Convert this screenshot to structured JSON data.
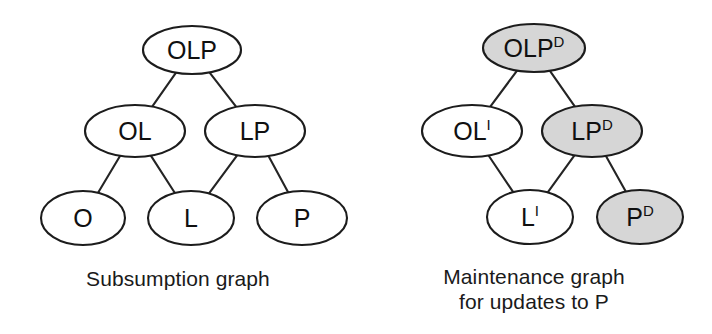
{
  "figure": {
    "background_color": "#ffffff",
    "node_stroke_color": "#1c1c1c",
    "node_fill_white": "#ffffff",
    "node_fill_gray": "#d6d6d6",
    "edge_color": "#242424",
    "text_color": "#101010"
  },
  "panels": [
    {
      "id": "subsumption",
      "caption_lines": [
        "Subsumption graph"
      ],
      "nodes": [
        {
          "id": "OLP",
          "base": "OLP",
          "sup": "",
          "fill": "white",
          "cx": 192,
          "cy": 50,
          "rx": 49,
          "ry": 24
        },
        {
          "id": "OL",
          "base": "OL",
          "sup": "",
          "fill": "white",
          "cx": 135,
          "cy": 131,
          "rx": 50,
          "ry": 26
        },
        {
          "id": "LP",
          "base": "LP",
          "sup": "",
          "fill": "white",
          "cx": 255,
          "cy": 131,
          "rx": 50,
          "ry": 26
        },
        {
          "id": "O",
          "base": "O",
          "sup": "",
          "fill": "white",
          "cx": 83,
          "cy": 218,
          "rx": 42,
          "ry": 27
        },
        {
          "id": "L",
          "base": "L",
          "sup": "",
          "fill": "white",
          "cx": 191,
          "cy": 218,
          "rx": 43,
          "ry": 27
        },
        {
          "id": "P",
          "base": "P",
          "sup": "",
          "fill": "white",
          "cx": 302,
          "cy": 218,
          "rx": 45,
          "ry": 27
        }
      ],
      "edges": [
        {
          "from": "OLP",
          "to": "OL"
        },
        {
          "from": "OLP",
          "to": "LP"
        },
        {
          "from": "OL",
          "to": "O"
        },
        {
          "from": "OL",
          "to": "L"
        },
        {
          "from": "LP",
          "to": "L"
        },
        {
          "from": "LP",
          "to": "P"
        }
      ]
    },
    {
      "id": "maintenance",
      "caption_lines": [
        "Maintenance graph",
        "for updates to P"
      ],
      "nodes": [
        {
          "id": "OLP_D",
          "base": "OLP",
          "sup": "D",
          "fill": "gray",
          "cx": 178,
          "cy": 48,
          "rx": 51,
          "ry": 24
        },
        {
          "id": "OL_I",
          "base": "OL",
          "sup": "I",
          "fill": "white",
          "cx": 116,
          "cy": 131,
          "rx": 50,
          "ry": 26
        },
        {
          "id": "LP_D",
          "base": "LP",
          "sup": "D",
          "fill": "gray",
          "cx": 236,
          "cy": 131,
          "rx": 50,
          "ry": 26
        },
        {
          "id": "L_I",
          "base": "L",
          "sup": "I",
          "fill": "white",
          "cx": 174,
          "cy": 217,
          "rx": 43,
          "ry": 27
        },
        {
          "id": "P_D",
          "base": "P",
          "sup": "D",
          "fill": "gray",
          "cx": 284,
          "cy": 217,
          "rx": 43,
          "ry": 27
        }
      ],
      "edges": [
        {
          "from": "OLP_D",
          "to": "OL_I"
        },
        {
          "from": "OLP_D",
          "to": "LP_D"
        },
        {
          "from": "OL_I",
          "to": "L_I"
        },
        {
          "from": "LP_D",
          "to": "L_I"
        },
        {
          "from": "LP_D",
          "to": "P_D"
        }
      ]
    }
  ]
}
